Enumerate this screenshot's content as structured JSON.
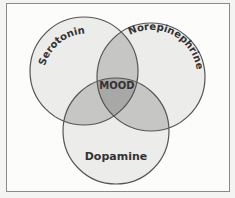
{
  "diagram": {
    "type": "venn",
    "sets": [
      {
        "id": "serotonin",
        "label": "Serotonin"
      },
      {
        "id": "norepinephrine",
        "label": "Norepinephrine"
      },
      {
        "id": "dopamine",
        "label": "Dopamine"
      }
    ],
    "center_label": "MOOD",
    "colors": {
      "circle_fill": "#ececea",
      "pair_overlap_fill": "#c6c6c4",
      "triple_overlap_fill": "#a8a8a6",
      "stroke": "#555555",
      "frame_border": "#8a8a8a",
      "text": "#333333"
    }
  }
}
